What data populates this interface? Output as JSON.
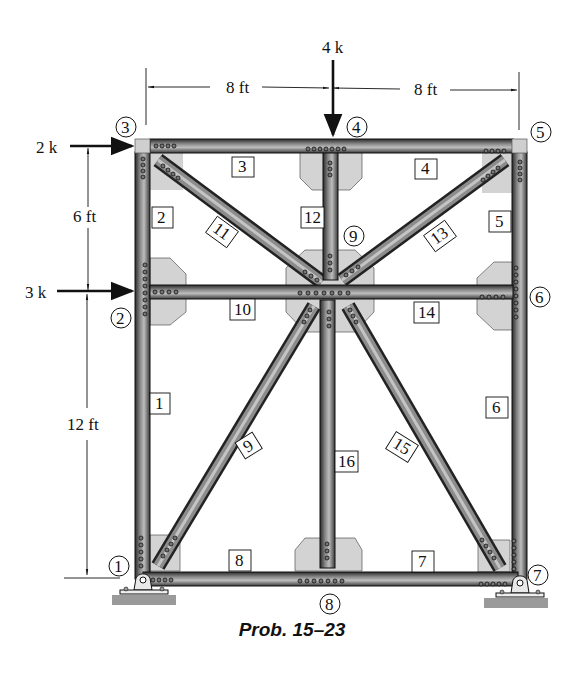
{
  "figure": {
    "caption": "Prob. 15–23",
    "colors": {
      "member_dark": "#2e2e2e",
      "member_mid": "#6f6f6f",
      "member_light": "#cfcfcf",
      "gusset": "#d3d3d3",
      "ground": "#9a9a9a",
      "text": "#111111"
    }
  },
  "loads": [
    {
      "id": "load-4k",
      "label": "4 k",
      "direction": "down",
      "node": 4
    },
    {
      "id": "load-2k",
      "label": "2 k",
      "direction": "right",
      "node": 3
    },
    {
      "id": "load-3k",
      "label": "3 k",
      "direction": "right",
      "node": 2
    }
  ],
  "dimensions": {
    "top_left": "8 ft",
    "top_right": "8 ft",
    "left_upper": "6 ft",
    "left_lower": "12 ft"
  },
  "nodes": [
    {
      "id": 1,
      "label": "1"
    },
    {
      "id": 2,
      "label": "2"
    },
    {
      "id": 3,
      "label": "3"
    },
    {
      "id": 4,
      "label": "4"
    },
    {
      "id": 5,
      "label": "5"
    },
    {
      "id": 6,
      "label": "6"
    },
    {
      "id": 7,
      "label": "7"
    },
    {
      "id": 8,
      "label": "8"
    },
    {
      "id": 9,
      "label": "9"
    }
  ],
  "members": [
    {
      "id": 1,
      "label": "1"
    },
    {
      "id": 2,
      "label": "2"
    },
    {
      "id": 3,
      "label": "3"
    },
    {
      "id": 4,
      "label": "4"
    },
    {
      "id": 5,
      "label": "5"
    },
    {
      "id": 6,
      "label": "6"
    },
    {
      "id": 7,
      "label": "7"
    },
    {
      "id": 8,
      "label": "8"
    },
    {
      "id": 9,
      "label": "9"
    },
    {
      "id": 10,
      "label": "10"
    },
    {
      "id": 11,
      "label": "11"
    },
    {
      "id": 12,
      "label": "12"
    },
    {
      "id": 13,
      "label": "13"
    },
    {
      "id": 14,
      "label": "14"
    },
    {
      "id": 15,
      "label": "15"
    },
    {
      "id": 16,
      "label": "16"
    }
  ]
}
